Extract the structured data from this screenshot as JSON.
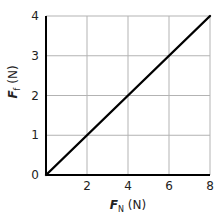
{
  "chart_data": {
    "type": "line",
    "title": "",
    "xlabel": {
      "symbol": "F",
      "subscript": "N",
      "unit": " (N)"
    },
    "ylabel": {
      "symbol": "F",
      "subscript": "f",
      "unit": " (N)"
    },
    "xlim": [
      0,
      8
    ],
    "ylim": [
      0,
      4
    ],
    "xticks": [
      2,
      4,
      6,
      8
    ],
    "yticks": [
      0,
      1,
      2,
      3,
      4
    ],
    "xtick_labels": [
      "2",
      "4",
      "6",
      "8"
    ],
    "ytick_labels": [
      "0",
      "1",
      "2",
      "3",
      "4"
    ],
    "grid": true,
    "legend": "none",
    "series": [
      {
        "name": "Ff vs FN",
        "x": [
          0,
          8
        ],
        "y": [
          0,
          4
        ],
        "color": "#000000"
      }
    ],
    "colors": {
      "grid": "#b3b3b3",
      "axis": "#000000",
      "line": "#000000"
    }
  }
}
